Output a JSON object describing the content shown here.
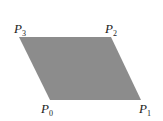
{
  "diagram": {
    "shape": "parallelogram",
    "fill": "#8c8c8c",
    "vertices": [
      {
        "name": "P0",
        "base": "P",
        "sub": "0",
        "x": 50,
        "y": 100
      },
      {
        "name": "P1",
        "base": "P",
        "sub": "1",
        "x": 141,
        "y": 100
      },
      {
        "name": "P2",
        "base": "P",
        "sub": "2",
        "x": 111,
        "y": 37
      },
      {
        "name": "P3",
        "base": "P",
        "sub": "3",
        "x": 19,
        "y": 37
      }
    ],
    "labels": {
      "p0": {
        "base": "P",
        "sub": "0"
      },
      "p1": {
        "base": "P",
        "sub": "1"
      },
      "p2": {
        "base": "P",
        "sub": "2"
      },
      "p3": {
        "base": "P",
        "sub": "3"
      }
    }
  }
}
